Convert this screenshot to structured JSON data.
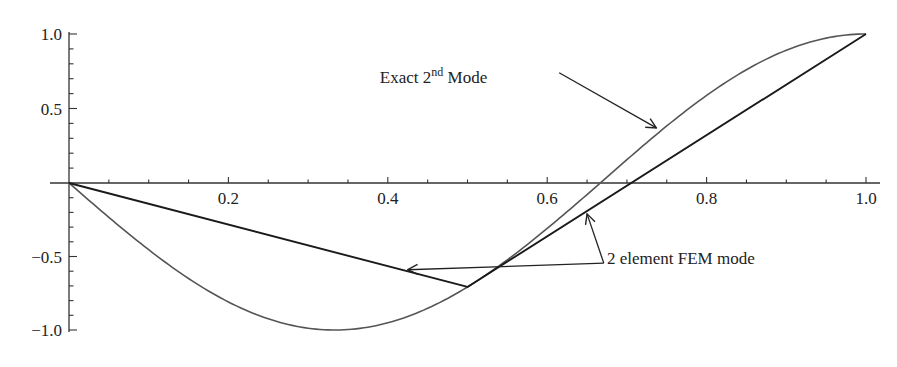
{
  "chart_data": {
    "type": "line",
    "title": "",
    "xlabel": "",
    "ylabel": "",
    "xlim": [
      0,
      1.0
    ],
    "ylim": [
      -1.0,
      1.0
    ],
    "grid": false,
    "legend": null,
    "x_ticks": [
      0.2,
      0.4,
      0.6,
      0.8,
      1.0
    ],
    "x_tick_labels": [
      "0.2",
      "0.4",
      "0.6",
      "0.8",
      "1.0"
    ],
    "x_minor_step": 0.05,
    "y_ticks": [
      1.0,
      0.5,
      -0.5,
      -1.0
    ],
    "y_tick_labels": [
      "1.0",
      "0.5",
      "−0.5",
      "−1.0"
    ],
    "y_minor_step": 0.1,
    "series": [
      {
        "name": "Exact 2nd Mode",
        "kind": "curve",
        "function": "-sin(1.5*pi*x)",
        "x": [
          0,
          0.1,
          0.2,
          0.3333,
          0.4,
          0.5,
          0.6,
          0.6667,
          0.7,
          0.8,
          0.9,
          1.0
        ],
        "values": [
          0,
          -0.454,
          -0.809,
          -1.0,
          -0.951,
          -0.707,
          -0.309,
          0,
          0.156,
          0.588,
          0.891,
          1.0
        ],
        "color": "#555555"
      },
      {
        "name": "2 element FEM mode",
        "kind": "piecewise-linear",
        "x": [
          0,
          0.5,
          1.0
        ],
        "values": [
          0,
          -0.707,
          1.0
        ],
        "color": "#1a1a1a"
      }
    ],
    "annotations": [
      {
        "text": "Exact 2",
        "superscript": "nd",
        "text_after": " Mode",
        "label_pos": [
          0.39,
          0.67
        ],
        "arrows": [
          {
            "from": [
              0.615,
              0.74
            ],
            "to": [
              0.737,
              0.37
            ]
          }
        ]
      },
      {
        "text": "2 element FEM mode",
        "label_pos": [
          0.675,
          -0.55
        ],
        "arrows": [
          {
            "from": [
              0.671,
              -0.545
            ],
            "to": [
              0.65,
              -0.21
            ]
          },
          {
            "from": [
              0.671,
              -0.545
            ],
            "to": [
              0.425,
              -0.59
            ]
          }
        ]
      }
    ]
  },
  "layout": {
    "px": {
      "x0": 69,
      "x1": 866,
      "y_top": 34,
      "y_zero": 183,
      "y_bottom": 330
    }
  }
}
